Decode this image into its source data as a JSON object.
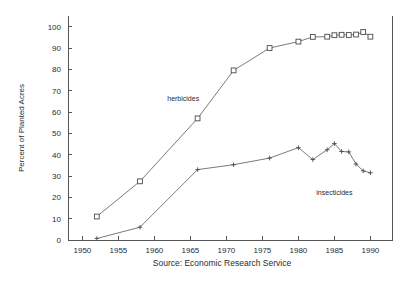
{
  "chart_data": {
    "type": "line",
    "title": "",
    "subtitle": "",
    "xlabel": "",
    "ylabel": "Percent of Planted Acres",
    "source": "Source: Economic Research Service",
    "xlim": [
      1948,
      1993
    ],
    "ylim": [
      0,
      105
    ],
    "xticks": [
      1950,
      1955,
      1960,
      1965,
      1970,
      1975,
      1980,
      1985,
      1990
    ],
    "yticks": [
      0,
      10,
      20,
      30,
      40,
      50,
      60,
      70,
      80,
      90,
      100
    ],
    "grid": false,
    "legend_position": "inline-annotations",
    "series": [
      {
        "name": "herbicides",
        "marker": "square",
        "label_x": 1964,
        "label_y": 65,
        "points": [
          {
            "x": 1952,
            "y": 11
          },
          {
            "x": 1958,
            "y": 27.5
          },
          {
            "x": 1966,
            "y": 57
          },
          {
            "x": 1971,
            "y": 79.5
          },
          {
            "x": 1976,
            "y": 90
          },
          {
            "x": 1980,
            "y": 93
          },
          {
            "x": 1982,
            "y": 95.2
          },
          {
            "x": 1984,
            "y": 95.3
          },
          {
            "x": 1985,
            "y": 96
          },
          {
            "x": 1986,
            "y": 96.2
          },
          {
            "x": 1987,
            "y": 96.1
          },
          {
            "x": 1988,
            "y": 96.3
          },
          {
            "x": 1989,
            "y": 97.5
          },
          {
            "x": 1990,
            "y": 95.3
          }
        ]
      },
      {
        "name": "insecticides",
        "marker": "plus",
        "label_x": 1985,
        "label_y": 21,
        "points": [
          {
            "x": 1952,
            "y": 0.7
          },
          {
            "x": 1958,
            "y": 6
          },
          {
            "x": 1966,
            "y": 33
          },
          {
            "x": 1971,
            "y": 35.3
          },
          {
            "x": 1976,
            "y": 38.4
          },
          {
            "x": 1980,
            "y": 43.3
          },
          {
            "x": 1982,
            "y": 37.7
          },
          {
            "x": 1984,
            "y": 42.3
          },
          {
            "x": 1985,
            "y": 45.2
          },
          {
            "x": 1986,
            "y": 41.5
          },
          {
            "x": 1987,
            "y": 41.3
          },
          {
            "x": 1988,
            "y": 35.6
          },
          {
            "x": 1989,
            "y": 32.4
          },
          {
            "x": 1990,
            "y": 31.5
          }
        ]
      }
    ]
  },
  "axes": {
    "y_title": "Percent of Planted Acres",
    "y_tick_labels": [
      "0",
      "10",
      "20",
      "30",
      "40",
      "50",
      "60",
      "70",
      "80",
      "90",
      "100"
    ],
    "x_tick_labels": [
      "1950",
      "1955",
      "1960",
      "1965",
      "1970",
      "1975",
      "1980",
      "1985",
      "1990"
    ]
  },
  "annotations": {
    "herbicides_label": "herbicides",
    "insecticides_label": "insecticides"
  },
  "footer": {
    "source": "Source: Economic Research Service"
  },
  "colors": {
    "line": "#6b6b6b",
    "marker_stroke": "#4a4a4a",
    "frame": "#555555",
    "text": "#2b2b2b",
    "background": "#ffffff"
  }
}
